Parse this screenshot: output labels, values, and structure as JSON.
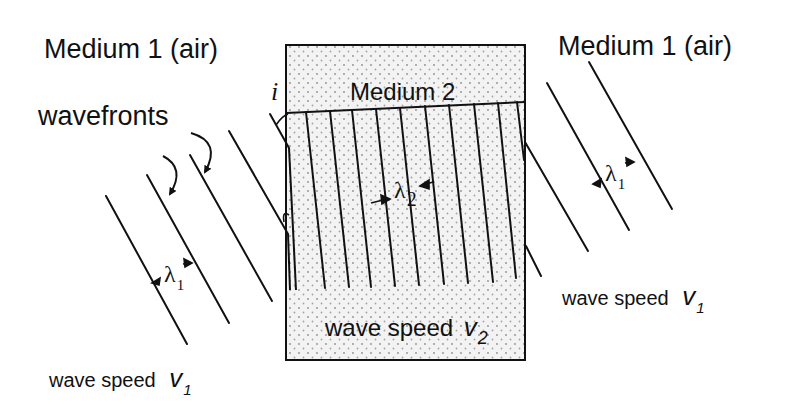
{
  "diagram": {
    "labels": {
      "medium1_left": "Medium 1 (air)",
      "medium1_right": "Medium 1 (air)",
      "medium2": "Medium 2",
      "wavefronts": "wavefronts",
      "angle_incidence": "i",
      "wave_speed_left_text": "wave speed",
      "wave_speed_left_symbol": "v",
      "wave_speed_left_sub": "1",
      "wave_speed_right_text": "wave speed",
      "wave_speed_right_symbol": "v",
      "wave_speed_right_sub": "1",
      "wave_speed_medium2_text": "wave speed",
      "wave_speed_medium2_symbol": "v",
      "wave_speed_medium2_sub": "2",
      "lambda1_left_symbol": "λ",
      "lambda1_left_sub": "1",
      "lambda1_right_symbol": "λ",
      "lambda1_right_sub": "1",
      "lambda2_symbol": "λ",
      "lambda2_sub": "2"
    },
    "colors": {
      "ink": "#111111",
      "medium2_fill": "#f1f1f1",
      "stipple": "#9a9a9a",
      "background": "#ffffff"
    }
  }
}
